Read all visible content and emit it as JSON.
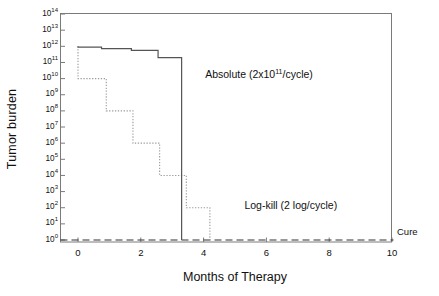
{
  "chart_data": {
    "type": "line",
    "title": "",
    "xlabel": "Months of Therapy",
    "ylabel": "Tumor burden",
    "xlim": [
      -0.5,
      10
    ],
    "ylim": [
      0,
      14
    ],
    "y_scale": "log10",
    "grid": false,
    "legend_position": "inline-annotations",
    "xticks": [
      0,
      2,
      4,
      6,
      8,
      10
    ],
    "xtick_labels": [
      "0",
      "2",
      "4",
      "6",
      "8",
      "10"
    ],
    "ytick_exponents": [
      0,
      1,
      2,
      3,
      4,
      5,
      6,
      7,
      8,
      9,
      10,
      11,
      12,
      13,
      14
    ],
    "ytick_labels": [
      "10<sup>0</sup>",
      "10<sup>1</sup>",
      "10<sup>2</sup>",
      "10<sup>3</sup>",
      "10<sup>4</sup>",
      "10<sup>5</sup>",
      "10<sup>6</sup>",
      "10<sup>7</sup>",
      "10<sup>8</sup>",
      "10<sup>9</sup>",
      "10<sup>10</sup>",
      "10<sup>11</sup>",
      "10<sup>12</sup>",
      "10<sup>13</sup>",
      "10<sup>14</sup>"
    ],
    "series": [
      {
        "name": "Absolute (2x10^11/cycle)",
        "style": "solid",
        "color": "#555555",
        "annotation": "Absolute (2x10<sup>11</sup>/cycle)",
        "annotation_x": 4.05,
        "annotation_y_exp": 10.2,
        "description": "Step function: subtractive kill of 2x10^11 cells per cycle starting from 1x10^12, then vertical drop to cure at month 3.3",
        "points_x": [
          0,
          0,
          0.75,
          0.75,
          1.7,
          1.7,
          2.55,
          2.55,
          3.3,
          3.3
        ],
        "points_y": [
          12.0,
          11.95,
          11.95,
          11.86,
          11.86,
          11.75,
          11.75,
          11.3,
          11.3,
          0.0
        ]
      },
      {
        "name": "Log-kill (2 log/cycle)",
        "style": "dotted",
        "color": "#9a9a9a",
        "annotation": "Log-kill (2 log/cycle)",
        "annotation_x": 5.3,
        "annotation_y_exp": 2.1,
        "description": "Step function: 2 log (100-fold) kill per cycle from 1x10^12 down through 10^10, 10^8, 10^6, 10^4, 10^2 reaching cure at month 4.2",
        "points_x": [
          0,
          0,
          0.9,
          0.9,
          1.75,
          1.75,
          2.6,
          2.6,
          3.45,
          3.45,
          4.2,
          4.2
        ],
        "points_y": [
          12.0,
          10.0,
          10.0,
          8.0,
          8.0,
          6.0,
          6.0,
          4.0,
          4.0,
          2.0,
          2.0,
          0.0
        ]
      }
    ],
    "reference_lines": [
      {
        "name": "cure-line",
        "label": "Cure",
        "style": "dashed",
        "orientation": "horizontal",
        "y_exp": 0.0,
        "color": "#333333"
      }
    ]
  },
  "axes": {
    "y_title": "Tumor burden",
    "x_title": "Months of Therapy"
  },
  "annotations": {
    "absolute": "Absolute (2x10",
    "absolute_sup": "11",
    "absolute_tail": "/cycle)",
    "logkill": "Log-kill (2 log/cycle)",
    "cure": "Cure"
  }
}
